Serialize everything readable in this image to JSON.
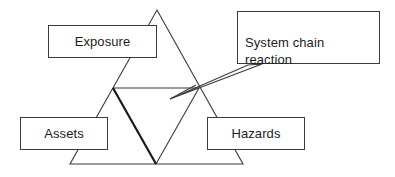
{
  "diagram": {
    "background_color": "#ffffff",
    "line_color": "#3a3a3a",
    "bold_line_color": "#1a1a1a",
    "text_color": "#1c1c1c",
    "nodes": [
      {
        "id": "exposure",
        "label": "Exposure"
      },
      {
        "id": "assets",
        "label": "Assets"
      },
      {
        "id": "hazards",
        "label": "Hazards"
      }
    ],
    "callout": {
      "id": "system-chain-reaction",
      "label": "System chain\nreaction",
      "line1": "System chain",
      "line2": "reaction"
    },
    "shapes": {
      "outer_triangle": {
        "apex": [
          157,
          10
        ],
        "base_left": [
          70,
          164
        ],
        "base_right": [
          243,
          164
        ]
      },
      "inner_triangle": {
        "left": [
          113,
          88
        ],
        "right": [
          199,
          88
        ],
        "bottom": [
          156,
          164
        ]
      },
      "bold_edge": {
        "from": [
          113,
          88
        ],
        "to": [
          156,
          164
        ],
        "width": 2
      },
      "pointer": {
        "tip": [
          170,
          99
        ],
        "upper_from": [
          262,
          64
        ],
        "lower_from": [
          248,
          65
        ]
      }
    }
  }
}
